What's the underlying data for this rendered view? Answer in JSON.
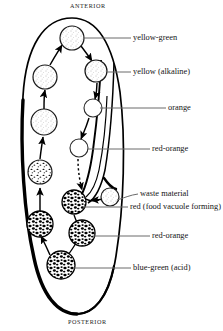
{
  "diagram": {
    "organism_outline_color": "#000000",
    "orientation": {
      "anterior": "ANTERIOR",
      "posterior": "POSTERIOR"
    },
    "labels": [
      {
        "id": "yellow-green",
        "text": "yellow-green",
        "x": 132,
        "y": 34,
        "leader_from": [
          128,
          38
        ],
        "leader_to": [
          84,
          38
        ]
      },
      {
        "id": "yellow-alkaline",
        "text": "yellow (alkaline)",
        "x": 132,
        "y": 68,
        "leader_from": [
          128,
          72
        ],
        "leader_to": [
          106,
          72
        ]
      },
      {
        "id": "orange",
        "text": "orange",
        "x": 168,
        "y": 104,
        "leader_from": [
          165,
          108
        ],
        "leader_to": [
          100,
          108
        ]
      },
      {
        "id": "red-orange-1",
        "text": "red-orange",
        "x": 152,
        "y": 145,
        "leader_from": [
          149,
          149
        ],
        "leader_to": [
          88,
          149
        ]
      },
      {
        "id": "waste-material",
        "text": "waste material",
        "x": 140,
        "y": 190,
        "leader_from": [
          137,
          194
        ],
        "leader_to": [
          117,
          200
        ]
      },
      {
        "id": "red-food-vacuole",
        "text": "red (food vacuole forming)",
        "x": 125,
        "y": 205,
        "leader_from": [
          128,
          209
        ],
        "leader_to": [
          82,
          208
        ]
      },
      {
        "id": "red-orange-2",
        "text": "red-orange",
        "x": 152,
        "y": 233,
        "leader_from": [
          149,
          237
        ],
        "leader_to": [
          90,
          237
        ]
      },
      {
        "id": "blue-green-acid",
        "text": "blue-green (acid)",
        "x": 132,
        "y": 266,
        "leader_from": [
          128,
          270
        ],
        "leader_to": [
          84,
          270
        ]
      }
    ],
    "vacuoles": [
      {
        "id": "v1-yellow-green",
        "cx": 72,
        "cy": 38,
        "r": 12,
        "fill": "light-stipple"
      },
      {
        "id": "v2-yellow",
        "cx": 96,
        "cy": 71,
        "r": 11,
        "fill": "light-stipple"
      },
      {
        "id": "v3-orange",
        "cx": 93,
        "cy": 108,
        "r": 9,
        "fill": "empty"
      },
      {
        "id": "v4-red-orange",
        "cx": 79,
        "cy": 148,
        "r": 9,
        "fill": "empty"
      },
      {
        "id": "v5-waste",
        "cx": 110,
        "cy": 197,
        "r": 9,
        "fill": "light-stipple"
      },
      {
        "id": "v6-red-forming",
        "cx": 74,
        "cy": 202,
        "r": 12,
        "fill": "dense-blobs"
      },
      {
        "id": "v7-red-orange",
        "cx": 82,
        "cy": 233,
        "r": 13,
        "fill": "dense-blobs"
      },
      {
        "id": "v8-blue-green",
        "cx": 61,
        "cy": 265,
        "r": 14,
        "fill": "dense-blobs"
      },
      {
        "id": "v9-left-lower",
        "cx": 40,
        "cy": 224,
        "r": 13,
        "fill": "dense-blobs"
      },
      {
        "id": "v10-left-mid",
        "cx": 40,
        "cy": 172,
        "r": 12,
        "fill": "medium-speckle"
      },
      {
        "id": "v11-left-upper",
        "cx": 44,
        "cy": 122,
        "r": 13,
        "fill": "light-stipple"
      },
      {
        "id": "v12-left-top",
        "cx": 45,
        "cy": 77,
        "r": 12,
        "fill": "light-stipple"
      }
    ]
  }
}
